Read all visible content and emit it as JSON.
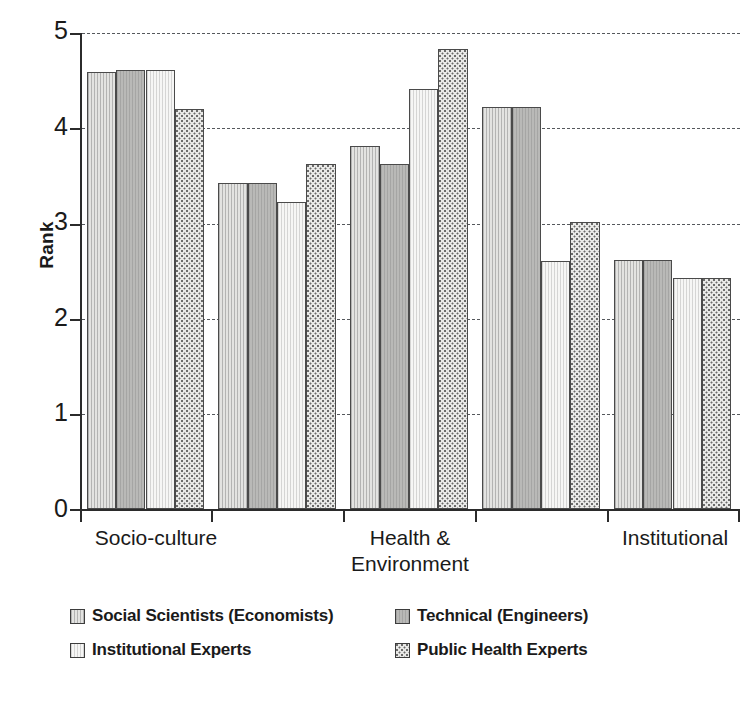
{
  "chart_data": {
    "type": "bar",
    "title": "",
    "subtitle": "",
    "xlabel": "",
    "ylabel": "Rank",
    "ylim": [
      0,
      5
    ],
    "yticks": [
      0,
      1,
      2,
      3,
      4,
      5
    ],
    "ytick_labels": [
      "0",
      "1",
      "2",
      "3",
      "4",
      "5"
    ],
    "grid": "horizontal-dashed",
    "legend_position": "bottom",
    "categories": [
      "Socio-culture",
      "",
      "Health &\nEnvironment",
      "",
      "Institutional"
    ],
    "visible_category_labels": [
      {
        "line1": "Socio-culture",
        "line2": ""
      },
      {
        "line1": "Health &",
        "line2": "Environment"
      },
      {
        "line1": "Institutional",
        "line2": ""
      }
    ],
    "series": [
      {
        "name": "Social Scientists (Economists)",
        "pattern": "vertical-hatch-light",
        "values": [
          4.59,
          3.42,
          3.81,
          4.22,
          2.62
        ]
      },
      {
        "name": "Technical (Engineers)",
        "pattern": "solid-gray",
        "values": [
          4.61,
          3.42,
          3.62,
          4.22,
          2.62
        ]
      },
      {
        "name": "Institutional Experts",
        "pattern": "white",
        "values": [
          4.61,
          3.22,
          4.41,
          2.61,
          2.43
        ]
      },
      {
        "name": "Public Health Experts",
        "pattern": "dotted",
        "values": [
          4.2,
          3.62,
          4.83,
          3.02,
          2.43
        ]
      }
    ]
  },
  "legend": {
    "entries": [
      {
        "label": "Social Scientists (Economists)",
        "swatch": "vertical-hatch-light"
      },
      {
        "label": "Technical (Engineers)",
        "swatch": "solid-gray"
      },
      {
        "label": "Institutional Experts",
        "swatch": "white"
      },
      {
        "label": "Public Health Experts",
        "swatch": "dotted"
      }
    ]
  },
  "colors": {
    "series_1": "#e3e3e1",
    "series_2": "#b9b9b7",
    "series_3": "#f6f6f5",
    "series_4": "#e9e9e7",
    "axis": "#2b2b2b",
    "gridline": "#55585c",
    "text": "#1a1a1a"
  }
}
